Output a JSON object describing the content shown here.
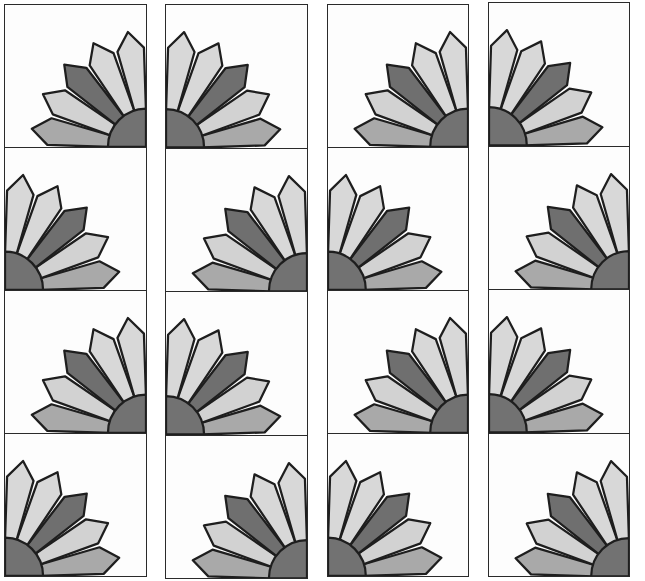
{
  "colors": {
    "background": "#fdfdfd",
    "outline": "#1e1e1e",
    "blade_light": "#d8d8d8",
    "blade_light2": "#d2d2d2",
    "blade_dark": "#6f6f6f",
    "blade_bottom": "#a9a9a9",
    "center": "#727272"
  },
  "layout": {
    "columns": 4,
    "rows_per_column": 4,
    "orientation_key": "BR = fan in bottom-right corner, BL = fan in bottom-left corner"
  },
  "strips": [
    {
      "x": 4,
      "y": 4,
      "width": 143,
      "height": 572,
      "blocks": [
        "BR",
        "BL",
        "BR",
        "BL"
      ]
    },
    {
      "x": 165,
      "y": 4,
      "width": 143,
      "height": 574,
      "blocks": [
        "BL",
        "BR",
        "BL",
        "BR"
      ]
    },
    {
      "x": 327,
      "y": 4,
      "width": 142,
      "height": 572,
      "blocks": [
        "BR",
        "BL",
        "BR",
        "BL"
      ]
    },
    {
      "x": 488,
      "y": 2,
      "width": 142,
      "height": 574,
      "blocks": [
        "BL",
        "BR",
        "BL",
        "BR"
      ]
    }
  ]
}
